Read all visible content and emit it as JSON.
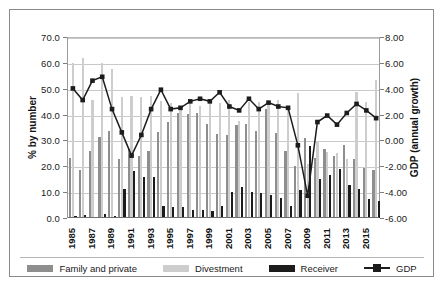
{
  "chart_data": {
    "type": "bar",
    "title": "",
    "subtitle": "",
    "xlabel": "",
    "ylabel": "% by number",
    "y2label": "GDP (annual growth)",
    "ylim": [
      0,
      70
    ],
    "y2lim": [
      -6,
      8
    ],
    "grid": true,
    "legend_position": "bottom",
    "y_ticks": [
      "0.0",
      "10.0",
      "20.0",
      "30.0",
      "40.0",
      "50.0",
      "60.0",
      "70.0"
    ],
    "y2_ticks": [
      "-6.00",
      "-4.00",
      "-2.00",
      "0.00",
      "2.00",
      "4.00",
      "6.00",
      "8.00"
    ],
    "categories": [
      "1985",
      "1986",
      "1987",
      "1988",
      "1989",
      "1990",
      "1991",
      "1992",
      "1993",
      "1994",
      "1995",
      "1996",
      "1997",
      "1998",
      "1999",
      "2000",
      "2001",
      "2002",
      "2003",
      "2004",
      "2005",
      "2006",
      "2007",
      "2008",
      "2009",
      "2010",
      "2011",
      "2012",
      "2013",
      "2014",
      "2015",
      "2016"
    ],
    "x_tick_labels": [
      "1985",
      "",
      "1987",
      "",
      "1989",
      "",
      "1991",
      "",
      "1993",
      "",
      "1995",
      "",
      "1997",
      "",
      "1999",
      "",
      "2001",
      "",
      "2003",
      "",
      "2005",
      "",
      "2007",
      "",
      "2009",
      "",
      "2011",
      "",
      "2013",
      "",
      "2015",
      ""
    ],
    "series": [
      {
        "name": "Family and private",
        "axis": "left",
        "color": "#8e8e8e",
        "values": [
          23.3,
          18.7,
          25.8,
          31.3,
          33.8,
          23.0,
          26.5,
          24.0,
          26.0,
          33.2,
          37.0,
          40.5,
          40.3,
          40.5,
          36.5,
          32.5,
          32.0,
          36.0,
          36.3,
          33.5,
          42.2,
          33.0,
          26.0,
          20.0,
          31.0,
          23.3,
          26.5,
          24.0,
          28.3,
          23.0,
          19.5,
          18.5
        ]
      },
      {
        "name": "Divestment",
        "axis": "left",
        "color": "#cdcdcd",
        "values": [
          59.8,
          62.0,
          45.8,
          60.0,
          57.5,
          46.8,
          47.3,
          46.8,
          47.3,
          45.3,
          44.3,
          43.0,
          44.8,
          43.5,
          44.8,
          44.5,
          45.8,
          37.7,
          44.8,
          45.0,
          44.0,
          45.5,
          43.5,
          48.2,
          20.8,
          29.7,
          25.5,
          25.0,
          23.0,
          48.8,
          45.0,
          53.3
        ]
      },
      {
        "name": "Receiver",
        "axis": "left",
        "color": "#1c1c1c",
        "values": [
          0.8,
          1.0,
          0.5,
          1.5,
          0.6,
          11.2,
          18.2,
          16.0,
          16.0,
          4.5,
          4.2,
          4.2,
          3.0,
          3.2,
          2.9,
          4.6,
          10.0,
          11.9,
          10.0,
          9.5,
          9.0,
          7.7,
          4.8,
          11.0,
          27.8,
          15.0,
          16.6,
          18.9,
          12.7,
          11.2,
          7.5,
          6.4
        ]
      },
      {
        "name": "GDP",
        "axis": "right",
        "color": "#1c1c1c",
        "marker": "square",
        "values": [
          4.1,
          3.2,
          4.7,
          5.0,
          2.5,
          0.7,
          -1.1,
          0.5,
          2.5,
          4.0,
          2.5,
          2.6,
          3.1,
          3.3,
          3.1,
          3.8,
          2.7,
          2.4,
          3.3,
          2.5,
          3.0,
          2.7,
          2.6,
          -0.3,
          -4.2,
          1.5,
          2.0,
          1.3,
          2.2,
          2.9,
          2.4,
          1.8
        ]
      }
    ]
  },
  "legend": {
    "items": [
      {
        "label": "Family and private",
        "swatch": "#8e8e8e",
        "kind": "bar"
      },
      {
        "label": "Divestment",
        "swatch": "#cdcdcd",
        "kind": "bar"
      },
      {
        "label": "Receiver",
        "swatch": "#1c1c1c",
        "kind": "bar"
      },
      {
        "label": "GDP",
        "swatch": "#1c1c1c",
        "kind": "line-marker"
      }
    ]
  }
}
